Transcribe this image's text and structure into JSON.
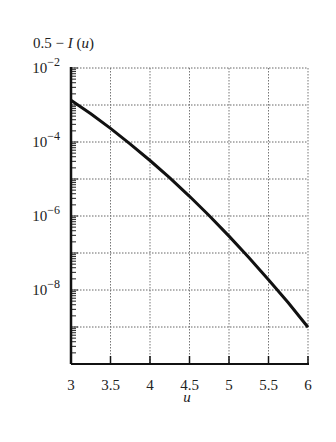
{
  "chart_data": {
    "type": "line",
    "title": "",
    "ylabel": "0.5 − I(u)",
    "xlabel": "u",
    "yscale": "log",
    "xlim": [
      3,
      6
    ],
    "ylim": [
      1e-10,
      0.01
    ],
    "grid": true,
    "x_ticks": [
      "3",
      "3.5",
      "4",
      "4.5",
      "5",
      "5.5",
      "6"
    ],
    "y_ticks": [
      {
        "base": "10",
        "exp": "-2",
        "value": 0.01
      },
      {
        "base": "10",
        "exp": "-4",
        "value": 0.0001
      },
      {
        "base": "10",
        "exp": "-6",
        "value": 1e-06
      },
      {
        "base": "10",
        "exp": "-8",
        "value": 1e-08
      }
    ],
    "series": [
      {
        "name": "0.5 − I(u)",
        "x": [
          3,
          3.25,
          3.5,
          3.75,
          4,
          4.25,
          4.5,
          4.75,
          5,
          5.25,
          5.5,
          5.75,
          6
        ],
        "values": [
          0.00135,
          0.00058,
          0.000233,
          8.8e-05,
          3.17e-05,
          1.07e-05,
          3.4e-06,
          1.02e-06,
          2.87e-07,
          7.6e-08,
          1.9e-08,
          4.5e-09,
          9.9e-10
        ]
      }
    ]
  }
}
